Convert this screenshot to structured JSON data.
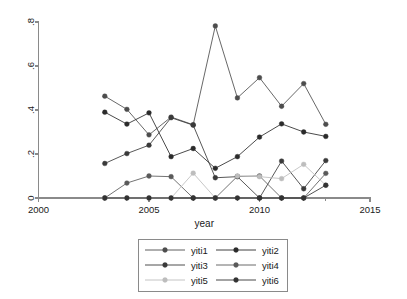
{
  "chart_data": {
    "type": "line",
    "title": "",
    "subtitle": "",
    "xlabel": "year",
    "ylabel": "",
    "xlim": [
      2000,
      2015
    ],
    "ylim": [
      0,
      0.8
    ],
    "xticks": [
      2000,
      2005,
      2010,
      2015
    ],
    "xtick_labels": [
      "2000",
      "2005",
      "2010",
      "2015"
    ],
    "yticks": [
      0,
      0.2,
      0.4,
      0.6,
      0.8
    ],
    "ytick_labels": [
      "0",
      ".2",
      ".4",
      ".6",
      ".8"
    ],
    "grid": false,
    "legend_position": "bottom",
    "x": [
      2003,
      2004,
      2005,
      2006,
      2007,
      2008,
      2009,
      2010,
      2011,
      2012,
      2013
    ],
    "series": [
      {
        "name": "yiti1",
        "color": "#4d4d4d",
        "marker": "circle",
        "values": [
          0.463,
          0.403,
          0.287,
          0.368,
          0.333,
          0.782,
          0.455,
          0.547,
          0.417,
          0.52,
          0.335
        ]
      },
      {
        "name": "yiti2",
        "color": "#2b2b2b",
        "marker": "circle",
        "values": [
          0.39,
          0.336,
          0.387,
          0.188,
          0.225,
          0.135,
          0.188,
          0.277,
          0.337,
          0.3,
          0.28
        ]
      },
      {
        "name": "yiti3",
        "color": "#3a3a3a",
        "marker": "circle",
        "values": [
          0.157,
          0.202,
          0.24,
          0.365,
          0.331,
          0.092,
          0.097,
          0.0,
          0.168,
          0.042,
          0.17
        ]
      },
      {
        "name": "yiti4",
        "color": "#5a5a5a",
        "marker": "circle",
        "values": [
          0.0,
          0.068,
          0.1,
          0.097,
          0.0,
          0.0,
          0.098,
          0.1,
          0.0,
          0.0,
          0.112
        ]
      },
      {
        "name": "yiti5",
        "color": "#bdbdbd",
        "marker": "circle",
        "values": [
          0.0,
          0.0,
          0.0,
          0.0,
          0.113,
          0.0,
          0.1,
          0.097,
          0.088,
          0.153,
          0.058
        ]
      },
      {
        "name": "yiti6",
        "color": "#333333",
        "marker": "circle",
        "values": [
          0.0,
          0.0,
          0.0,
          0.0,
          0.0,
          0.0,
          0.0,
          0.0,
          0.0,
          0.0,
          0.058
        ]
      }
    ],
    "legend_entries": [
      {
        "label": "yiti1",
        "color": "#4d4d4d"
      },
      {
        "label": "yiti2",
        "color": "#2b2b2b"
      },
      {
        "label": "yiti3",
        "color": "#3a3a3a"
      },
      {
        "label": "yiti4",
        "color": "#5a5a5a"
      },
      {
        "label": "yiti5",
        "color": "#bdbdbd"
      },
      {
        "label": "yiti6",
        "color": "#333333"
      }
    ]
  }
}
